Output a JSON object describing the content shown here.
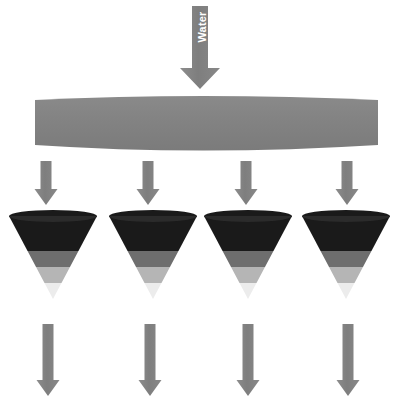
{
  "diagram": {
    "background_color": "#ffffff",
    "width": 402,
    "height": 407,
    "inlet": {
      "label": "Water",
      "label_color": "#ffffff",
      "arrow_color": "#7f7f7f",
      "arrow_name": "water-inlet-arrow",
      "shaft": {
        "x": 192,
        "y": 6,
        "width": 16,
        "height": 62
      },
      "head": {
        "left": 180,
        "right": 220,
        "top": 68,
        "tip_y": 89
      }
    },
    "distributor": {
      "name": "distribution-bar",
      "color": "#808080",
      "x": 35,
      "y": 97,
      "width": 343,
      "height": 51,
      "shape": "flattened-cylinder"
    },
    "feed_arrows": {
      "color": "#7f7f7f",
      "count": 4,
      "shaft_width": 11,
      "head_width": 23,
      "top_y": 161,
      "tip_y": 205,
      "centers": [
        46,
        148,
        246,
        347
      ]
    },
    "funnels": {
      "count": 4,
      "top_y": 216,
      "tip_y": 299,
      "top_width": 88,
      "centers": [
        53,
        153,
        248,
        346
      ],
      "bands": [
        {
          "name": "dark-band",
          "color": "#1a1a1a",
          "start": 0.0,
          "end": 0.42
        },
        {
          "name": "medium-gray-band",
          "color": "#6e6e6e",
          "start": 0.42,
          "end": 0.61
        },
        {
          "name": "light-gray-band",
          "color": "#b5b5b5",
          "start": 0.61,
          "end": 0.81
        },
        {
          "name": "pale-band",
          "color": "#ececec",
          "start": 0.81,
          "end": 1.0
        }
      ]
    },
    "outlet_arrows": {
      "color": "#7f7f7f",
      "count": 4,
      "shaft_width": 11,
      "head_width": 23,
      "top_y": 324,
      "tip_y": 396,
      "centers": [
        48,
        150,
        248,
        348
      ]
    }
  }
}
